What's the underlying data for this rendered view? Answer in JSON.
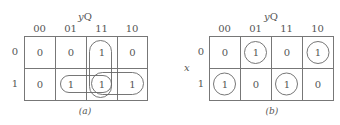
{
  "maps": [
    {
      "id": "a",
      "caption": "(a)",
      "col_var_label": "yQ",
      "row_var_label": "",
      "col_headers": [
        "00",
        "01",
        "11",
        "10"
      ],
      "row_headers": [
        "0",
        "1"
      ],
      "cells": [
        [
          "0",
          "0",
          "1",
          "0"
        ],
        [
          "0",
          "1",
          "1",
          "1"
        ]
      ],
      "groupings": [
        {
          "name": "column-11-pair",
          "cells": [
            [
              0,
              2
            ],
            [
              1,
              2
            ]
          ],
          "shape": "vertical-oval"
        },
        {
          "name": "row1-cols-01-11",
          "cells": [
            [
              1,
              1
            ],
            [
              1,
              2
            ]
          ],
          "shape": "horizontal-oval"
        },
        {
          "name": "row1-cols-11-10",
          "cells": [
            [
              1,
              2
            ],
            [
              1,
              3
            ]
          ],
          "shape": "horizontal-oval"
        }
      ]
    },
    {
      "id": "b",
      "caption": "(b)",
      "col_var_label": "yQ",
      "row_var_label": "x",
      "col_headers": [
        "00",
        "01",
        "11",
        "10"
      ],
      "row_headers": [
        "0",
        "1"
      ],
      "cells": [
        [
          "0",
          "1",
          "0",
          "1"
        ],
        [
          "1",
          "0",
          "1",
          "0"
        ]
      ],
      "groupings": [
        {
          "name": "single-r0c1",
          "cells": [
            [
              0,
              1
            ]
          ],
          "shape": "circle"
        },
        {
          "name": "single-r0c3",
          "cells": [
            [
              0,
              3
            ]
          ],
          "shape": "circle"
        },
        {
          "name": "single-r1c0",
          "cells": [
            [
              1,
              0
            ]
          ],
          "shape": "circle"
        },
        {
          "name": "single-r1c2",
          "cells": [
            [
              1,
              2
            ]
          ],
          "shape": "circle"
        }
      ]
    }
  ]
}
